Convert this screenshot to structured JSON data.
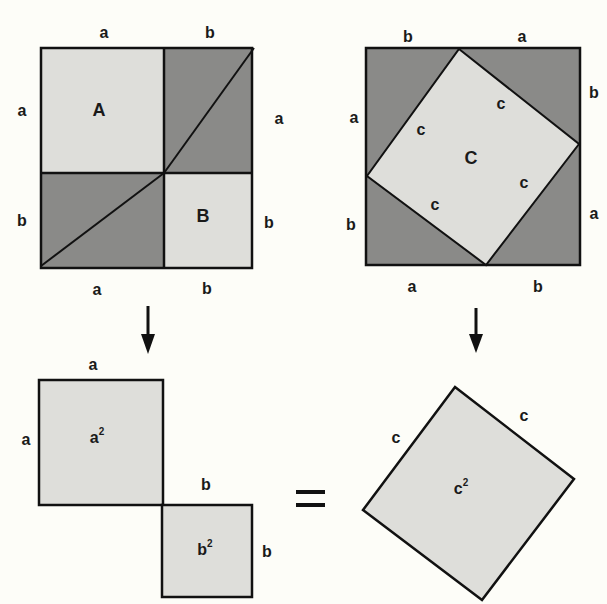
{
  "colors": {
    "background": "#fdfdf8",
    "light_fill": "#dededa",
    "dark_fill": "#8a8a88",
    "stroke": "#111111"
  },
  "left_square": {
    "top_labels": [
      "a",
      "b"
    ],
    "left_labels": [
      "a",
      "b"
    ],
    "right_labels": [
      "a",
      "b"
    ],
    "bottom_labels": [
      "a",
      "b"
    ],
    "region_a_label": "A",
    "region_b_label": "B"
  },
  "right_square": {
    "top_labels": [
      "b",
      "a"
    ],
    "left_labels": [
      "a",
      "b"
    ],
    "right_labels": [
      "b",
      "a"
    ],
    "bottom_labels": [
      "a",
      "b"
    ],
    "inner_side_labels": [
      "c",
      "c",
      "c",
      "c"
    ],
    "region_c_label": "C"
  },
  "bottom_left": {
    "square_a_top": "a",
    "square_a_side": "a",
    "square_a_area": "a",
    "square_a_exp": "2",
    "square_b_top": "b",
    "square_b_side": "b",
    "square_b_area": "b",
    "square_b_exp": "2"
  },
  "equals": "=",
  "bottom_right": {
    "side_left": "c",
    "side_right": "c",
    "area": "c",
    "exp": "2"
  }
}
